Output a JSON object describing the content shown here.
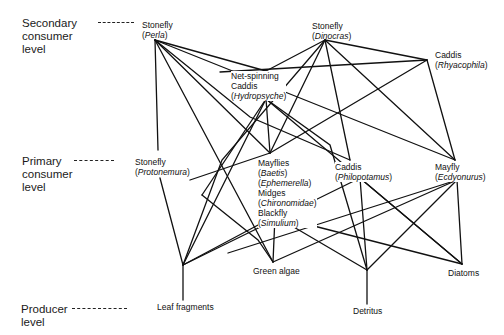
{
  "levels": {
    "secondary": [
      "Secondary",
      "consumer",
      "level"
    ],
    "primary": [
      "Primary",
      "consumer",
      "level"
    ],
    "producer": [
      "Producer",
      "level"
    ]
  },
  "nodes": {
    "perla": {
      "common": "Stonefly",
      "genus": "Perla"
    },
    "dinocras": {
      "common": "Stonefly",
      "genus": "Dinocras"
    },
    "rhyacophila": {
      "common": "Caddis",
      "genus": "Rhyacophila"
    },
    "hydropsyche": {
      "common1": "Net-spinning",
      "common2": "Caddis",
      "genus": "Hydropsyche"
    },
    "protonemura": {
      "common": "Stonefly",
      "genus": "Protonemura"
    },
    "mayflies": {
      "common": "Mayflies",
      "genus1": "Baetis",
      "genus2": "Ephemerella",
      "midges": "Midges",
      "midges_taxon": "Chironomidae",
      "blackfly": "Blackfly",
      "blackfly_genus": "Simulium"
    },
    "philopotamus": {
      "common": "Caddis",
      "genus": "Philopotamus"
    },
    "ecdyonurus": {
      "common": "Mayfly",
      "genus": "Ecdyonurus"
    },
    "leaf": {
      "label": "Leaf fragments"
    },
    "algae": {
      "label": "Green algae"
    },
    "detritus": {
      "label": "Detritus"
    },
    "diatoms": {
      "label": "Diatoms"
    }
  },
  "colors": {
    "line": "#111111",
    "text": "#111111",
    "background": "#ffffff"
  }
}
